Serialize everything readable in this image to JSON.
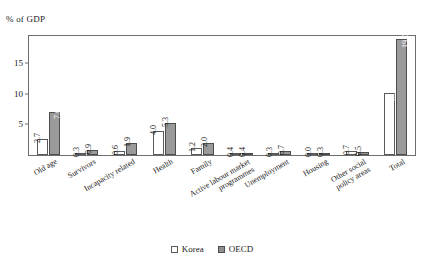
{
  "chart_data": {
    "type": "bar",
    "title": "",
    "subtitle": "",
    "xlabel": "",
    "ylabel": "% of GDP",
    "ylim": [
      0,
      19.5
    ],
    "yticks": [
      5,
      10,
      15
    ],
    "ytick_labels": [
      "5",
      "10",
      "15"
    ],
    "grid": false,
    "legend_position": "bottom-center",
    "categories": [
      "Old age",
      "Survivors",
      "Incapacity related",
      "Health",
      "Family",
      "Active labour market\nprogrammes",
      "Unemployment",
      "Housing",
      "Other social\npolicy areas",
      "Total"
    ],
    "series": [
      {
        "name": "Korea",
        "color": "#ffffff",
        "values": [
          2.7,
          0.3,
          0.6,
          4.0,
          1.2,
          0.4,
          0.3,
          0.0,
          0.7,
          10.2
        ],
        "labels": [
          "2.7",
          "0.3",
          "0.6",
          "4.0",
          "1.2",
          "0.4",
          "0.3",
          "0.0",
          "0.7",
          "10.2"
        ]
      },
      {
        "name": "OECD",
        "color": "#9a9a9a",
        "values": [
          7.0,
          0.9,
          1.9,
          5.3,
          2.0,
          0.4,
          0.7,
          0.3,
          0.5,
          19.0
        ],
        "labels": [
          "7.0",
          "0.9",
          "1.9",
          "5.3",
          "2.0",
          "0.4",
          "0.7",
          "0.3",
          "0.5",
          "19.0"
        ]
      }
    ]
  },
  "legend": {
    "items": [
      {
        "label": "Korea",
        "key": "korea"
      },
      {
        "label": "OECD",
        "key": "oecd"
      }
    ]
  }
}
